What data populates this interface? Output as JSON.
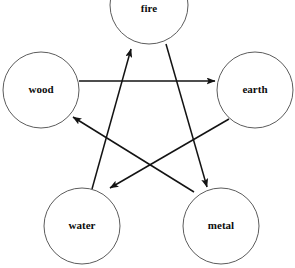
{
  "diagram": {
    "background_color": "#ffffff",
    "node_stroke_color": "#4a4a4a",
    "edge_color": "#131313",
    "label_color": "#0d0d0d",
    "nodes": [
      {
        "id": "fire",
        "label": "fire",
        "cx": 149,
        "cy": 5,
        "r": 39,
        "label_x": 149,
        "label_y": 9
      },
      {
        "id": "wood",
        "label": "wood",
        "cx": 41,
        "cy": 90,
        "r": 38,
        "label_x": 41,
        "label_y": 90
      },
      {
        "id": "earth",
        "label": "earth",
        "cx": 255,
        "cy": 90,
        "r": 38,
        "label_x": 255,
        "label_y": 90
      },
      {
        "id": "water",
        "label": "water",
        "cx": 82,
        "cy": 226,
        "r": 38,
        "label_x": 82,
        "label_y": 226
      },
      {
        "id": "metal",
        "label": "metal",
        "cx": 221,
        "cy": 226,
        "r": 38,
        "label_x": 221,
        "label_y": 226
      }
    ],
    "edges": [
      {
        "id": "wood-to-earth",
        "from": "wood",
        "to": "earth",
        "x1": 79,
        "y1": 81,
        "x2": 215,
        "y2": 81
      },
      {
        "id": "earth-to-water",
        "from": "earth",
        "to": "water",
        "x1": 229,
        "y1": 119,
        "x2": 110,
        "y2": 188
      },
      {
        "id": "water-to-fire",
        "from": "water",
        "to": "fire",
        "x1": 92,
        "y1": 189,
        "x2": 131,
        "y2": 49
      },
      {
        "id": "fire-to-metal",
        "from": "fire",
        "to": "metal",
        "x1": 166,
        "y1": 44,
        "x2": 207,
        "y2": 187
      },
      {
        "id": "metal-to-wood",
        "from": "metal",
        "to": "wood",
        "x1": 194,
        "y1": 192,
        "x2": 73,
        "y2": 117
      }
    ]
  }
}
